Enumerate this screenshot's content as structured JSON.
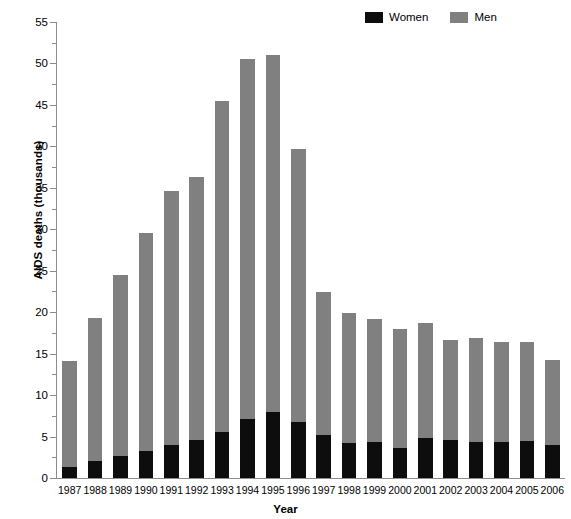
{
  "chart_data": {
    "type": "bar",
    "subtype": "stacked-vertical",
    "title": "",
    "xlabel": "Year",
    "ylabel": "AIDS deaths (thousands)",
    "ylim": [
      0,
      55
    ],
    "ytick_step": 5,
    "yminor_step": 2.5,
    "grid": false,
    "legend_position": "top-right",
    "categories": [
      "1987",
      "1988",
      "1989",
      "1990",
      "1991",
      "1992",
      "1993",
      "1994",
      "1995",
      "1996",
      "1997",
      "1998",
      "1999",
      "2000",
      "2001",
      "2002",
      "2003",
      "2004",
      "2005",
      "2006"
    ],
    "ytick_labels": [
      "0",
      "5",
      "10",
      "15",
      "20",
      "25",
      "30",
      "35",
      "40",
      "45",
      "50",
      "55"
    ],
    "series": [
      {
        "name": "Women",
        "color": "#0d0d0d",
        "values": [
          1.3,
          2.0,
          2.7,
          3.2,
          4.0,
          4.6,
          5.6,
          7.1,
          8.0,
          6.7,
          5.2,
          4.2,
          4.3,
          3.6,
          4.8,
          4.6,
          4.4,
          4.4,
          4.5,
          4.0
        ]
      },
      {
        "name": "Men",
        "color": "#808080",
        "values": [
          12.8,
          17.3,
          21.8,
          26.3,
          30.6,
          31.7,
          39.9,
          43.4,
          43.0,
          33.0,
          17.2,
          15.7,
          14.9,
          14.4,
          13.9,
          12.1,
          12.5,
          12.0,
          11.9,
          10.2
        ]
      }
    ],
    "totals": [
      14.1,
      19.3,
      24.5,
      29.5,
      34.6,
      36.3,
      45.5,
      50.5,
      51.0,
      39.7,
      22.4,
      19.9,
      19.2,
      18.0,
      18.7,
      16.7,
      16.9,
      16.4,
      16.4,
      14.2
    ]
  },
  "legend": {
    "entries": [
      {
        "label": "Women",
        "color": "#0d0d0d"
      },
      {
        "label": "Men",
        "color": "#808080"
      }
    ]
  },
  "axes": {
    "y_title": "AIDS deaths (thousands)",
    "x_title": "Year"
  },
  "colors": {
    "women": "#0d0d0d",
    "men": "#808080",
    "axis": "#8c8c8c",
    "background": "#ffffff"
  }
}
